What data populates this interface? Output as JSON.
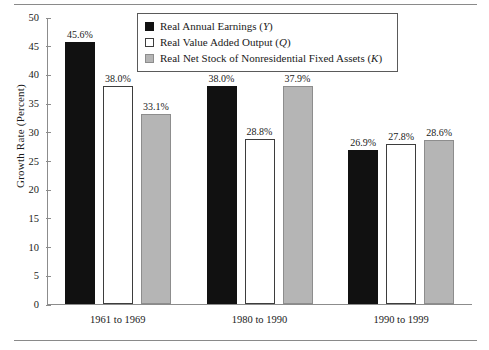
{
  "chart_data": {
    "type": "bar",
    "title": "",
    "xlabel": "",
    "ylabel": "Growth Rate (Percent)",
    "ylim": [
      0,
      50
    ],
    "ytick_step": 5,
    "yticks": [
      0,
      5,
      10,
      15,
      20,
      25,
      30,
      35,
      40,
      45,
      50
    ],
    "ytick_labels": [
      "0",
      "5",
      "10",
      "15",
      "20",
      "25",
      "30",
      "35",
      "40",
      "45",
      "50"
    ],
    "grid": false,
    "legend_position": "top-center",
    "categories": [
      "1961 to 1969",
      "1980 to 1990",
      "1990 to 1999"
    ],
    "series": [
      {
        "name": "Real Annual Earnings (Y)",
        "symbol": "Y",
        "color": "#111111",
        "values": [
          45.6,
          38.0,
          26.9
        ],
        "value_labels": [
          "45.6%",
          "38.0%",
          "26.9%"
        ]
      },
      {
        "name": "Real Value Added Output (Q)",
        "symbol": "Q",
        "color": "#ffffff",
        "values": [
          38.0,
          28.8,
          27.8
        ],
        "value_labels": [
          "38.0%",
          "28.8%",
          "27.8%"
        ]
      },
      {
        "name": "Real Net Stock of Nonresidential Fixed Assets (K)",
        "symbol": "K",
        "color": "#b5b5b5",
        "values": [
          33.1,
          37.9,
          28.6
        ],
        "value_labels": [
          "33.1%",
          "37.9%",
          "28.6%"
        ]
      }
    ]
  },
  "legend": {
    "entries": [
      {
        "label_main": "Real Annual Earnings (",
        "symbol": "Y",
        "label_end": ")"
      },
      {
        "label_main": "Real Value Added Output (",
        "symbol": "Q",
        "label_end": ")"
      },
      {
        "label_main": "Real Net Stock of Nonresidential Fixed Assets (",
        "symbol": "K",
        "label_end": ")"
      }
    ]
  }
}
